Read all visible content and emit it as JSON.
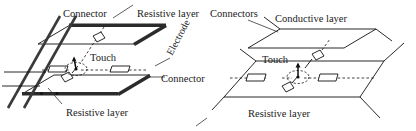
{
  "figure": {
    "background_color": "#ffffff",
    "ink_color": "#111111",
    "bar_color": "#2b2b2b"
  },
  "left_diagram": {
    "name": "four-wire-resistive-touchscreen",
    "labels": {
      "top_left": "Connector",
      "top_right": "Resistive layer",
      "center": "Touch",
      "right_rotated": "Electrode",
      "right_lower": "Connector",
      "bottom": "Resistive layer"
    }
  },
  "right_diagram": {
    "name": "five-wire-resistive-touchscreen",
    "labels": {
      "top_left": "Connectors",
      "top_right": "Conductive layer",
      "center": "Touch",
      "bottom": "Resistive layer"
    }
  }
}
